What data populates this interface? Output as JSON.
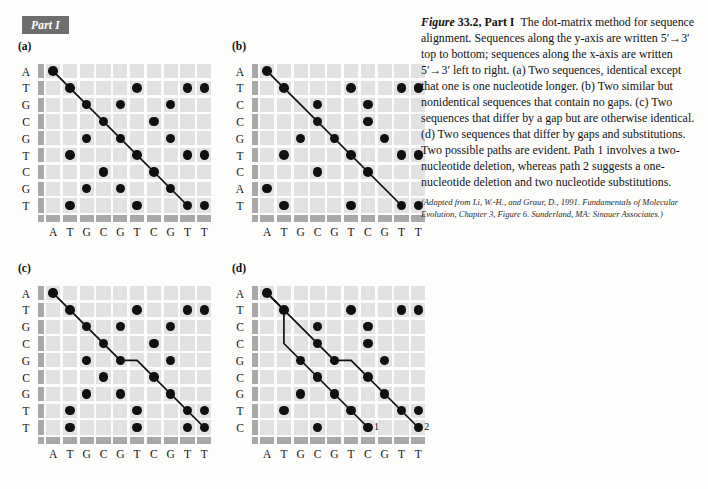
{
  "part_tab": "Part I",
  "caption": {
    "fig_label": "Figure",
    "fig_number": "33.2, Part I",
    "body": "The dot-matrix method for sequence alignment. Sequences along the y-axis are written 5′→3′ top to bottom; sequences along the x-axis are written 5′→3′ left to right. (a) Two sequences, identical except that one is one nucleotide longer. (b) Two similar but nonidentical sequences that contain no gaps. (c) Two sequences that differ by a gap but are otherwise identical. (d) Two sequences that differ by gaps and substitutions. Two possible paths are evident. Path 1 involves a two-nucleotide deletion, whereas path 2 suggests a one-nucleotide deletion and two nucleotide substitutions.",
    "source": "(Adapted from Li, W.-H., and Graur, D., 1991. Fundamentals of Molecular Evolution, Chapter 3, Figure 6. Sunderland, MA: Sinauer Associates.)"
  },
  "colors": {
    "cell": "#e2e2e2",
    "band": "#a8a8a8",
    "dot": "#101010",
    "tab_bg": "#6e6e6e",
    "page_bg": "#fdfdfb"
  },
  "chart_data": {
    "type": "scatter",
    "xlabel": "x-axis sequence 5′→3′ left to right",
    "ylabel": "y-axis sequence 5′→3′ top to bottom",
    "panels": [
      {
        "id": "a",
        "label": "(a)",
        "x_sequence": [
          "A",
          "T",
          "G",
          "C",
          "G",
          "T",
          "C",
          "G",
          "T",
          "T"
        ],
        "y_sequence": [
          "A",
          "T",
          "G",
          "C",
          "G",
          "T",
          "C",
          "G",
          "T"
        ],
        "dots": [
          [
            0,
            0
          ],
          [
            1,
            1
          ],
          [
            5,
            1
          ],
          [
            8,
            1
          ],
          [
            9,
            1
          ],
          [
            2,
            2
          ],
          [
            4,
            2
          ],
          [
            7,
            2
          ],
          [
            3,
            3
          ],
          [
            6,
            3
          ],
          [
            2,
            4
          ],
          [
            4,
            4
          ],
          [
            7,
            4
          ],
          [
            1,
            5
          ],
          [
            5,
            5
          ],
          [
            8,
            5
          ],
          [
            9,
            5
          ],
          [
            3,
            6
          ],
          [
            6,
            6
          ],
          [
            2,
            7
          ],
          [
            4,
            7
          ],
          [
            7,
            7
          ],
          [
            1,
            8
          ],
          [
            5,
            8
          ],
          [
            8,
            8
          ],
          [
            9,
            8
          ]
        ],
        "paths": [
          {
            "name": "path-main",
            "points": [
              [
                0,
                0
              ],
              [
                8,
                8
              ]
            ],
            "label": ""
          }
        ]
      },
      {
        "id": "b",
        "label": "(b)",
        "x_sequence": [
          "A",
          "T",
          "G",
          "C",
          "G",
          "T",
          "C",
          "G",
          "T",
          "T"
        ],
        "y_sequence": [
          "A",
          "T",
          "C",
          "C",
          "G",
          "T",
          "C",
          "A",
          "T"
        ],
        "dots": [
          [
            0,
            0
          ],
          [
            1,
            1
          ],
          [
            5,
            1
          ],
          [
            8,
            1
          ],
          [
            9,
            1
          ],
          [
            3,
            2
          ],
          [
            6,
            2
          ],
          [
            3,
            3
          ],
          [
            6,
            3
          ],
          [
            2,
            4
          ],
          [
            4,
            4
          ],
          [
            7,
            4
          ],
          [
            1,
            5
          ],
          [
            5,
            5
          ],
          [
            8,
            5
          ],
          [
            9,
            5
          ],
          [
            3,
            6
          ],
          [
            6,
            6
          ],
          [
            0,
            7
          ],
          [
            1,
            8
          ],
          [
            5,
            8
          ],
          [
            8,
            8
          ],
          [
            9,
            8
          ]
        ],
        "paths": [
          {
            "name": "path-main",
            "points": [
              [
                0,
                0
              ],
              [
                8,
                8
              ]
            ],
            "label": ""
          }
        ]
      },
      {
        "id": "c",
        "label": "(c)",
        "x_sequence": [
          "A",
          "T",
          "G",
          "C",
          "G",
          "T",
          "C",
          "G",
          "T",
          "T"
        ],
        "y_sequence": [
          "A",
          "T",
          "G",
          "C",
          "G",
          "C",
          "G",
          "T",
          "T"
        ],
        "dots": [
          [
            0,
            0
          ],
          [
            1,
            1
          ],
          [
            5,
            1
          ],
          [
            8,
            1
          ],
          [
            9,
            1
          ],
          [
            2,
            2
          ],
          [
            4,
            2
          ],
          [
            7,
            2
          ],
          [
            3,
            3
          ],
          [
            6,
            3
          ],
          [
            2,
            4
          ],
          [
            4,
            4
          ],
          [
            7,
            4
          ],
          [
            3,
            5
          ],
          [
            6,
            5
          ],
          [
            2,
            6
          ],
          [
            4,
            6
          ],
          [
            7,
            6
          ],
          [
            1,
            7
          ],
          [
            5,
            7
          ],
          [
            8,
            7
          ],
          [
            9,
            7
          ],
          [
            1,
            8
          ],
          [
            5,
            8
          ],
          [
            8,
            8
          ],
          [
            9,
            8
          ]
        ],
        "paths": [
          {
            "name": "path-main",
            "points": [
              [
                0,
                0
              ],
              [
                4,
                4
              ],
              [
                5,
                4
              ],
              [
                9,
                8
              ]
            ],
            "label": ""
          }
        ]
      },
      {
        "id": "d",
        "label": "(d)",
        "x_sequence": [
          "A",
          "T",
          "G",
          "C",
          "G",
          "T",
          "C",
          "G",
          "T",
          "T"
        ],
        "y_sequence": [
          "A",
          "T",
          "C",
          "C",
          "G",
          "C",
          "G",
          "T",
          "C"
        ],
        "dots": [
          [
            0,
            0
          ],
          [
            1,
            1
          ],
          [
            5,
            1
          ],
          [
            8,
            1
          ],
          [
            9,
            1
          ],
          [
            3,
            2
          ],
          [
            6,
            2
          ],
          [
            3,
            3
          ],
          [
            6,
            3
          ],
          [
            2,
            4
          ],
          [
            4,
            4
          ],
          [
            7,
            4
          ],
          [
            3,
            5
          ],
          [
            6,
            5
          ],
          [
            2,
            6
          ],
          [
            4,
            6
          ],
          [
            7,
            6
          ],
          [
            1,
            7
          ],
          [
            5,
            7
          ],
          [
            8,
            7
          ],
          [
            9,
            7
          ],
          [
            3,
            8
          ],
          [
            6,
            8
          ],
          [
            9,
            8
          ]
        ],
        "paths": [
          {
            "name": "path-1",
            "points": [
              [
                0,
                0
              ],
              [
                1,
                1
              ],
              [
                1,
                3
              ],
              [
                6,
                8
              ]
            ],
            "label": "1"
          },
          {
            "name": "path-2",
            "points": [
              [
                0,
                0
              ],
              [
                4,
                4
              ],
              [
                5,
                4
              ],
              [
                9,
                8
              ]
            ],
            "label": "2"
          }
        ]
      }
    ]
  }
}
